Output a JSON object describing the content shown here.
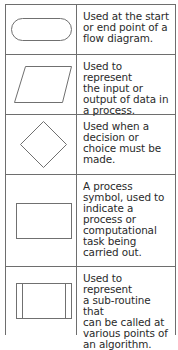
{
  "rows": [
    {
      "symbol": "terminator-oval",
      "description": "Used at the start\nor end point of a\nflow diagram."
    },
    {
      "symbol": "input-output-parallelogram",
      "description": "Used to represent\nthe input or\noutput of data in\na process."
    },
    {
      "symbol": "decision-diamond",
      "description": "Used when a\ndecision or\nchoice must be\nmade."
    },
    {
      "symbol": "process-rectangle",
      "description": "A process\nsymbol, used to\nindicate a\nprocess or\ncomputational\ntask being\ncarried out."
    },
    {
      "symbol": "subroutine-box",
      "description": "Used to represent\na sub-routine that\ncan be called at\nvarious points of\nan algorithm."
    }
  ]
}
